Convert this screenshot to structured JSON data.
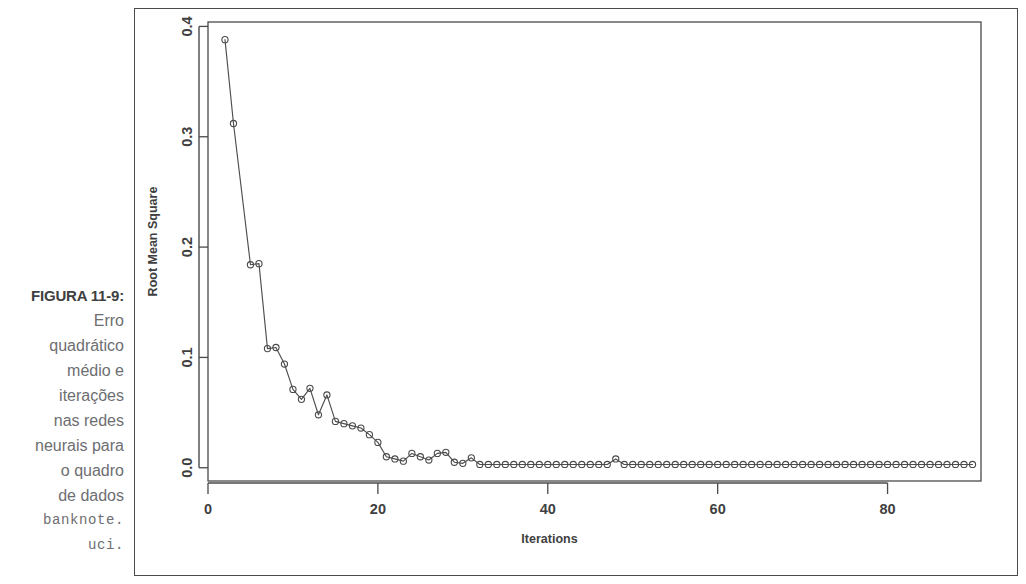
{
  "caption": {
    "figure_number": "FIGURA 11-9:",
    "lines": [
      {
        "text": "Erro",
        "mono": false
      },
      {
        "text": "quadrático",
        "mono": false
      },
      {
        "text": "médio e",
        "mono": false
      },
      {
        "text": "iterações",
        "mono": false
      },
      {
        "text": "nas redes",
        "mono": false
      },
      {
        "text": "neurais para",
        "mono": false
      },
      {
        "text": "o quadro",
        "mono": false
      },
      {
        "text": "de dados",
        "mono": false
      },
      {
        "text": "banknote.",
        "mono": true
      },
      {
        "text": "uci.",
        "mono": true
      }
    ]
  },
  "colors": {
    "ink": "#4a4a4c",
    "caption_text": "#6d6e71",
    "caption_bold": "#3f3f41",
    "background": "#ffffff"
  },
  "chart_data": {
    "type": "scatter",
    "title": "",
    "xlabel": "Iterations",
    "ylabel": "Root Mean Square",
    "xlim": [
      0,
      91
    ],
    "ylim": [
      -0.012,
      0.404
    ],
    "xticks": [
      0,
      20,
      40,
      60,
      80
    ],
    "xtick_labels": [
      "0",
      "20",
      "40",
      "60",
      "80"
    ],
    "yticks": [
      0.0,
      0.1,
      0.2,
      0.3,
      0.4
    ],
    "ytick_labels": [
      "0.0",
      "0.1",
      "0.2",
      "0.3",
      "0.4"
    ],
    "grid": false,
    "legend": null,
    "marker": "open-circle",
    "connected": true,
    "x": [
      2,
      3,
      5,
      6,
      7,
      8,
      9,
      10,
      11,
      12,
      13,
      14,
      15,
      16,
      17,
      18,
      19,
      20,
      21,
      22,
      23,
      24,
      25,
      26,
      27,
      28,
      29,
      30,
      31,
      32,
      33,
      34,
      35,
      36,
      37,
      38,
      39,
      40,
      41,
      42,
      43,
      44,
      45,
      46,
      47,
      48,
      49,
      50,
      51,
      52,
      53,
      54,
      55,
      56,
      57,
      58,
      59,
      60,
      61,
      62,
      63,
      64,
      65,
      66,
      67,
      68,
      69,
      70,
      71,
      72,
      73,
      74,
      75,
      76,
      77,
      78,
      79,
      80,
      81,
      82,
      83,
      84,
      85,
      86,
      87,
      88,
      89,
      90
    ],
    "y": [
      0.388,
      0.312,
      0.184,
      0.185,
      0.108,
      0.109,
      0.094,
      0.071,
      0.062,
      0.072,
      0.048,
      0.066,
      0.042,
      0.04,
      0.038,
      0.036,
      0.03,
      0.023,
      0.01,
      0.008,
      0.006,
      0.013,
      0.01,
      0.007,
      0.013,
      0.014,
      0.005,
      0.004,
      0.009,
      0.003,
      0.003,
      0.003,
      0.003,
      0.003,
      0.003,
      0.003,
      0.003,
      0.003,
      0.003,
      0.003,
      0.003,
      0.003,
      0.003,
      0.003,
      0.003,
      0.008,
      0.003,
      0.003,
      0.003,
      0.003,
      0.003,
      0.003,
      0.003,
      0.003,
      0.003,
      0.003,
      0.003,
      0.003,
      0.003,
      0.003,
      0.003,
      0.003,
      0.003,
      0.003,
      0.003,
      0.003,
      0.003,
      0.003,
      0.003,
      0.003,
      0.003,
      0.003,
      0.003,
      0.003,
      0.003,
      0.003,
      0.003,
      0.003,
      0.003,
      0.003,
      0.003,
      0.003,
      0.003,
      0.003,
      0.003,
      0.003,
      0.003,
      0.003
    ]
  }
}
